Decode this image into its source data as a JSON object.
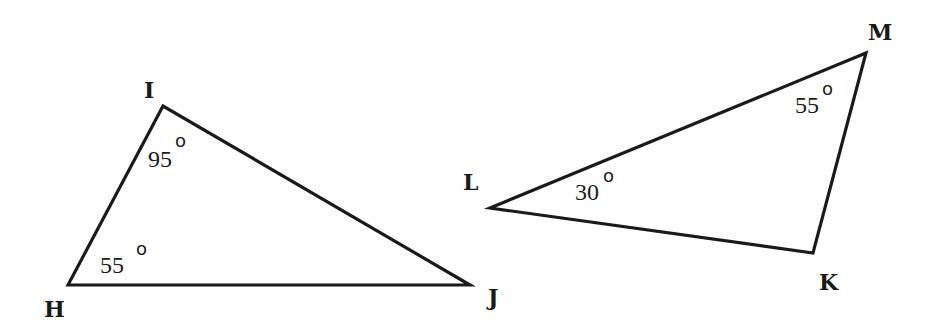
{
  "diagram": {
    "type": "geometry-triangles",
    "background": "#ffffff",
    "stroke_color": "#1a1a1a",
    "triangles": [
      {
        "name": "HIJ",
        "vertices": {
          "H": {
            "label": "H",
            "x": 68,
            "y": 285
          },
          "I": {
            "label": "I",
            "x": 163,
            "y": 106
          },
          "J": {
            "label": "J",
            "x": 470,
            "y": 285
          }
        },
        "angles": [
          {
            "vertex": "I",
            "value": "95",
            "unit": "°"
          },
          {
            "vertex": "H",
            "value": "55",
            "unit": "°"
          }
        ]
      },
      {
        "name": "LMK",
        "vertices": {
          "L": {
            "label": "L",
            "x": 490,
            "y": 208
          },
          "M": {
            "label": "M",
            "x": 866,
            "y": 53
          },
          "K": {
            "label": "K",
            "x": 813,
            "y": 253
          }
        },
        "angles": [
          {
            "vertex": "L",
            "value": "30",
            "unit": "°"
          },
          {
            "vertex": "M",
            "value": "55",
            "unit": "°"
          }
        ]
      }
    ],
    "labels": {
      "H": "H",
      "I": "I",
      "J": "J",
      "L": "L",
      "M": "M",
      "K": "K",
      "angle_I": "95",
      "angle_H": "55",
      "angle_L": "30",
      "angle_M": "55",
      "degree_symbol": "o"
    }
  }
}
